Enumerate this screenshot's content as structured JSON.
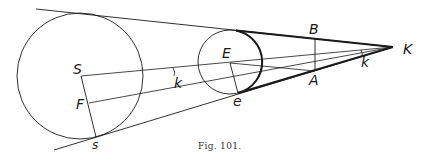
{
  "figure": {
    "caption": "Fig. 101.",
    "labels": {
      "S": "S",
      "F": "F",
      "s": "s",
      "k_left": "k",
      "E": "E",
      "e": "e",
      "B": "B",
      "A": "A",
      "k_right": "k",
      "K": "K"
    },
    "colors": {
      "stroke": "#1a1a1a",
      "background": "#ffffff"
    }
  }
}
